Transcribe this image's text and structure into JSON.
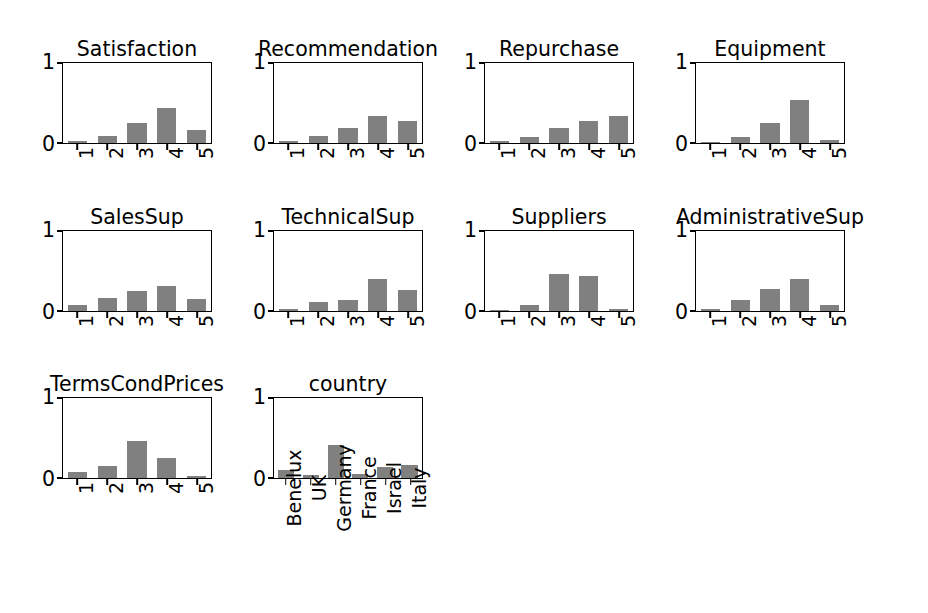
{
  "figure": {
    "background_color": "#ffffff",
    "bar_color": "#808080",
    "axis_color": "#000000",
    "rows": 3,
    "cols": 4
  },
  "chart_data": [
    {
      "type": "bar",
      "title": "Satisfaction",
      "categories": [
        "1",
        "2",
        "3",
        "4",
        "5"
      ],
      "values": [
        0.02,
        0.09,
        0.25,
        0.44,
        0.16
      ],
      "xlabel": "",
      "ylabel": "",
      "ylim": [
        0,
        1
      ],
      "yticks": [
        "0",
        "1"
      ],
      "grid": false,
      "legend": "none"
    },
    {
      "type": "bar",
      "title": "Recommendation",
      "categories": [
        "1",
        "2",
        "3",
        "4",
        "5"
      ],
      "values": [
        0.02,
        0.09,
        0.19,
        0.34,
        0.28
      ],
      "xlabel": "",
      "ylabel": "",
      "ylim": [
        0,
        1
      ],
      "yticks": [
        "0",
        "1"
      ],
      "grid": false,
      "legend": "none"
    },
    {
      "type": "bar",
      "title": "Repurchase",
      "categories": [
        "1",
        "2",
        "3",
        "4",
        "5"
      ],
      "values": [
        0.03,
        0.08,
        0.19,
        0.28,
        0.34
      ],
      "xlabel": "",
      "ylabel": "",
      "ylim": [
        0,
        1
      ],
      "yticks": [
        "0",
        "1"
      ],
      "grid": false,
      "legend": "none"
    },
    {
      "type": "bar",
      "title": "Equipment",
      "categories": [
        "1",
        "2",
        "3",
        "4",
        "5"
      ],
      "values": [
        0.01,
        0.07,
        0.26,
        0.55,
        0.04
      ],
      "xlabel": "",
      "ylabel": "",
      "ylim": [
        0,
        1
      ],
      "yticks": [
        "0",
        "1"
      ],
      "grid": false,
      "legend": "none"
    },
    {
      "type": "bar",
      "title": "SalesSup",
      "categories": [
        "1",
        "2",
        "3",
        "4",
        "5"
      ],
      "values": [
        0.07,
        0.16,
        0.26,
        0.32,
        0.15
      ],
      "xlabel": "",
      "ylabel": "",
      "ylim": [
        0,
        1
      ],
      "yticks": [
        "0",
        "1"
      ],
      "grid": false,
      "legend": "none"
    },
    {
      "type": "bar",
      "title": "TechnicalSup",
      "categories": [
        "1",
        "2",
        "3",
        "4",
        "5"
      ],
      "values": [
        0.03,
        0.11,
        0.14,
        0.41,
        0.27
      ],
      "xlabel": "",
      "ylabel": "",
      "ylim": [
        0,
        1
      ],
      "yticks": [
        "0",
        "1"
      ],
      "grid": false,
      "legend": "none"
    },
    {
      "type": "bar",
      "title": "Suppliers",
      "categories": [
        "1",
        "2",
        "3",
        "4",
        "5"
      ],
      "values": [
        0.005,
        0.07,
        0.47,
        0.44,
        0.02
      ],
      "xlabel": "",
      "ylabel": "",
      "ylim": [
        0,
        1
      ],
      "yticks": [
        "0",
        "1"
      ],
      "grid": false,
      "legend": "none"
    },
    {
      "type": "bar",
      "title": "AdministrativeSup",
      "categories": [
        "1",
        "2",
        "3",
        "4",
        "5"
      ],
      "values": [
        0.02,
        0.14,
        0.28,
        0.41,
        0.07
      ],
      "xlabel": "",
      "ylabel": "",
      "ylim": [
        0,
        1
      ],
      "yticks": [
        "0",
        "1"
      ],
      "grid": false,
      "legend": "none"
    },
    {
      "type": "bar",
      "title": "TermsCondPrices",
      "categories": [
        "1",
        "2",
        "3",
        "4",
        "5"
      ],
      "values": [
        0.07,
        0.15,
        0.47,
        0.25,
        0.02
      ],
      "xlabel": "",
      "ylabel": "",
      "ylim": [
        0,
        1
      ],
      "yticks": [
        "0",
        "1"
      ],
      "grid": false,
      "legend": "none"
    },
    {
      "type": "bar",
      "title": "country",
      "categories": [
        "Benelux",
        "UK",
        "Germany",
        "France",
        "Israel",
        "Italy"
      ],
      "values": [
        0.1,
        0.04,
        0.42,
        0.05,
        0.14,
        0.17
      ],
      "xlabel": "",
      "ylabel": "",
      "ylim": [
        0,
        1
      ],
      "yticks": [
        "0",
        "1"
      ],
      "grid": false,
      "legend": "none"
    }
  ],
  "panel_layout": [
    {
      "left": 62,
      "top": 62,
      "width": 150,
      "height": 82
    },
    {
      "left": 273,
      "top": 62,
      "width": 150,
      "height": 82
    },
    {
      "left": 484,
      "top": 62,
      "width": 150,
      "height": 82
    },
    {
      "left": 695,
      "top": 62,
      "width": 150,
      "height": 82
    },
    {
      "left": 62,
      "top": 230,
      "width": 150,
      "height": 82
    },
    {
      "left": 273,
      "top": 230,
      "width": 150,
      "height": 82
    },
    {
      "left": 484,
      "top": 230,
      "width": 150,
      "height": 82
    },
    {
      "left": 695,
      "top": 230,
      "width": 150,
      "height": 82
    },
    {
      "left": 62,
      "top": 397,
      "width": 150,
      "height": 82
    },
    {
      "left": 273,
      "top": 397,
      "width": 150,
      "height": 82
    }
  ]
}
